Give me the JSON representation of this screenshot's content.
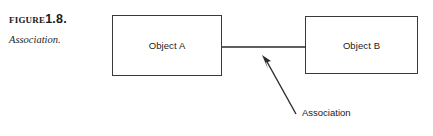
{
  "figure": {
    "label_word": "Figure",
    "number": "1.8.",
    "subtitle": "Association."
  },
  "diagram": {
    "type": "uml-object-association",
    "boxes": [
      {
        "id": "a",
        "label": "Object A"
      },
      {
        "id": "b",
        "label": "Object B"
      }
    ],
    "connector": {
      "name": "association-line",
      "from": "Object A",
      "to": "Object B"
    },
    "annotation": {
      "label": "Association",
      "points_to": "association-line"
    }
  },
  "colors": {
    "background": "#ffffff",
    "box_border": "#3a3a3a",
    "line": "#2b2b2b",
    "text": "#1a1a1a"
  }
}
